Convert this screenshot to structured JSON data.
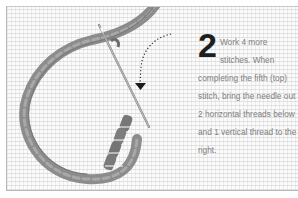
{
  "instruction": {
    "step_number": "2",
    "text": "Work 4 more stitches. When completing the fifth (top) stitch, bring the needle out 2 horizontal threads below and 1 vertical thread to the right."
  },
  "illustration": {
    "subject": "needlepoint-canvas-with-yarn-and-needle",
    "colors": {
      "canvas_bg": "#fbfbfb",
      "canvas_grid": "#d0d0d0",
      "yarn": "#8c8c8c",
      "yarn_dark": "#6e6e6e",
      "needle": "#9a9a9a",
      "arrow": "#1a1a1a",
      "step_number": "#1e1e1e",
      "body_text": "#808080",
      "frame_border": "#b8b8b8"
    }
  }
}
